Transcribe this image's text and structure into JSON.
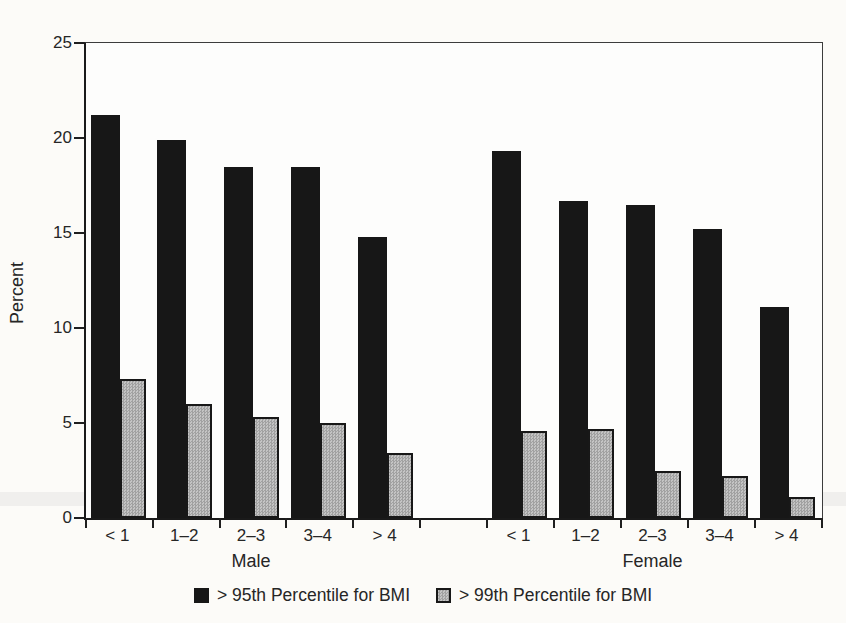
{
  "chart_data": {
    "type": "bar",
    "title": "",
    "xlabel": "",
    "ylabel": "Percent",
    "ylim": [
      0,
      25
    ],
    "yticks": [
      0,
      5,
      10,
      15,
      20,
      25
    ],
    "grid": false,
    "legend_position": "bottom-center",
    "categories": [
      "< 1",
      "1–2",
      "2–3",
      "3–4",
      "> 4"
    ],
    "groups": [
      {
        "label": "Male",
        "series": [
          {
            "name": "> 95th Percentile for BMI",
            "values": [
              21.2,
              19.9,
              18.5,
              18.5,
              14.8
            ]
          },
          {
            "name": "> 99th Percentile for BMI",
            "values": [
              7.3,
              6.0,
              5.3,
              5.0,
              3.4
            ]
          }
        ]
      },
      {
        "label": "Female",
        "series": [
          {
            "name": "> 95th Percentile for BMI",
            "values": [
              19.3,
              16.7,
              16.5,
              15.2,
              11.1
            ]
          },
          {
            "name": "> 99th Percentile for BMI",
            "values": [
              4.6,
              4.7,
              2.5,
              2.2,
              1.1
            ]
          }
        ]
      }
    ],
    "legend": [
      {
        "label": "> 95th Percentile for BMI",
        "color": "#171717",
        "swatch": "black-filled-square-icon"
      },
      {
        "label": "> 99th Percentile for BMI",
        "color": "#bcbcbc",
        "swatch": "gray-stippled-square-icon"
      }
    ]
  }
}
